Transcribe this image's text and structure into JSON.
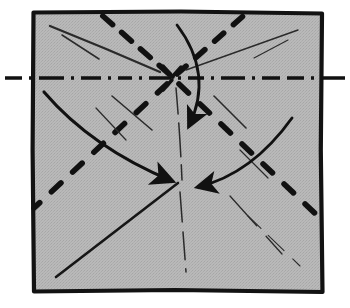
{
  "figure": {
    "kind": "origami-diagram",
    "canvas": {
      "width": 350,
      "height": 308
    },
    "background_color": "#ffffff",
    "paper": {
      "name": "square-paper-sheet",
      "fill_color": "#b6b6b6",
      "stroke_color": "#111111",
      "stroke_width": 4,
      "corners": {
        "top_left": [
          33,
          12
        ],
        "top_right": [
          322,
          13
        ],
        "bottom_right": [
          322,
          292
        ],
        "bottom_left": [
          34,
          291
        ]
      }
    },
    "center_point": {
      "name": "collapse-center",
      "x": 172,
      "y": 78
    },
    "lower_center_point": {
      "name": "lower-convergence-point",
      "x": 178,
      "y": 182
    },
    "axis_line": {
      "name": "horizontal-axis-dash-dot",
      "style": "dash-dot",
      "color": "#111111",
      "width": 3.2,
      "y": 78,
      "x_start": 5,
      "x_end": 345,
      "note": "extends beyond both left and right paper edges"
    },
    "fold_lines": [
      {
        "name": "fold-dashed-center-to-top-left",
        "style": "thick-dashed",
        "from": [
          172,
          78
        ],
        "to": [
          96,
          10
        ]
      },
      {
        "name": "fold-dashed-center-to-top-right",
        "style": "thick-dashed",
        "from": [
          172,
          78
        ],
        "to": [
          247,
          12
        ]
      },
      {
        "name": "fold-dashed-center-to-bottom-left",
        "style": "thick-dashed",
        "from": [
          172,
          78
        ],
        "to": [
          36,
          206
        ]
      },
      {
        "name": "fold-dashed-center-to-bottom-right",
        "style": "thick-dashed",
        "from": [
          172,
          78
        ],
        "to": [
          320,
          218
        ]
      }
    ],
    "thin_creases": [
      {
        "name": "crease-thin-upper-left-long",
        "from": [
          50,
          26
        ],
        "to": [
          160,
          72
        ]
      },
      {
        "name": "crease-thin-upper-left-short",
        "from": [
          62,
          35
        ],
        "to": [
          98,
          58
        ]
      },
      {
        "name": "crease-thin-upper-right-long",
        "from": [
          296,
          30
        ],
        "to": [
          186,
          70
        ]
      },
      {
        "name": "crease-thin-upper-right-short",
        "from": [
          286,
          40
        ],
        "to": [
          252,
          58
        ]
      },
      {
        "name": "crease-thin-center-down",
        "from": [
          176,
          88
        ],
        "to": [
          182,
          180
        ]
      },
      {
        "name": "crease-thin-lower-center-down",
        "from": [
          180,
          190
        ],
        "to": [
          186,
          270
        ]
      },
      {
        "name": "crease-thin-lower-right-fan",
        "from": [
          232,
          196
        ],
        "to": [
          280,
          252
        ]
      },
      {
        "name": "crease-thin-lower-right-edge",
        "from": [
          246,
          214
        ],
        "to": [
          300,
          266
        ]
      },
      {
        "name": "crease-thin-upper-mid-left",
        "from": [
          112,
          96
        ],
        "to": [
          150,
          128
        ]
      },
      {
        "name": "crease-thin-upper-mid-right",
        "from": [
          212,
          96
        ],
        "to": [
          244,
          128
        ]
      }
    ],
    "solid_lines": [
      {
        "name": "solid-line-bottom-left-to-center",
        "from": [
          56,
          276
        ],
        "to": [
          178,
          182
        ]
      }
    ],
    "arrows": [
      {
        "name": "arrow-curved-top-down",
        "description": "large curved arrow sweeping from top edge down past center, head pointing down",
        "start": [
          178,
          24
        ],
        "control": [
          212,
          78
        ],
        "end": [
          188,
          128
        ],
        "head_angle_deg": 100
      },
      {
        "name": "arrow-curved-left-to-center",
        "description": "curved arrow from left edge sweeping down-right to convergence point",
        "start": [
          44,
          92
        ],
        "control": [
          96,
          150
        ],
        "end": [
          172,
          180
        ],
        "head_angle_deg": 24
      },
      {
        "name": "arrow-curved-right-to-center",
        "description": "curved arrow from right side sweeping left to convergence point",
        "start": [
          290,
          120
        ],
        "control": [
          250,
          172
        ],
        "end": [
          196,
          186
        ],
        "head_angle_deg": 195
      }
    ],
    "legend_semantics": {
      "thick_dashed": "fold line (valley/mountain crease)",
      "dash_dot": "axis / center line",
      "thin_solid": "existing crease or edge",
      "arrow": "fold direction"
    }
  }
}
